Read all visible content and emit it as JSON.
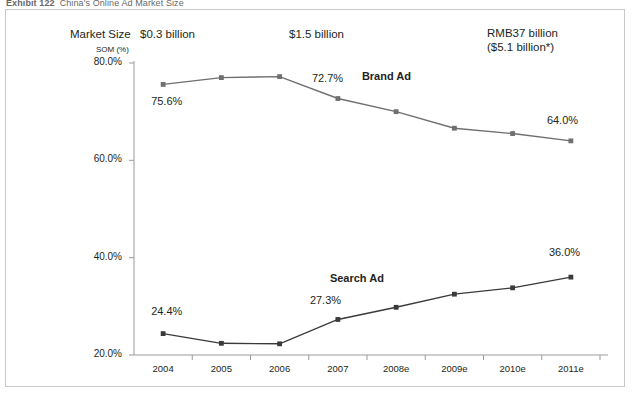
{
  "exhibit": {
    "number": "Exhibit 122",
    "title": "China's Online Ad Market Size"
  },
  "header": {
    "market_size_label": "Market Size",
    "size_2004": "$0.3 billion",
    "size_2007": "$1.5 billion",
    "size_2011_line1": "RMB37 billion",
    "size_2011_line2": "($5.1 billion*)"
  },
  "chart_data": {
    "type": "line",
    "title": "China's Online Ad Market Size",
    "xlabel": "",
    "ylabel": "SOM (%)",
    "ylim": [
      20,
      80
    ],
    "yticks": [
      20,
      40,
      60,
      80
    ],
    "ytick_labels": [
      "20.0%",
      "40.0%",
      "60.0%",
      "80.0%"
    ],
    "grid": false,
    "legend": "inline-annotations",
    "categories": [
      "2004",
      "2005",
      "2006",
      "2007",
      "2008e",
      "2009e",
      "2010e",
      "2011e"
    ],
    "series": [
      {
        "name": "Brand Ad",
        "values": [
          75.6,
          77.0,
          77.2,
          72.7,
          70.0,
          66.6,
          65.5,
          64.0
        ],
        "color": "#6f6f6f"
      },
      {
        "name": "Search Ad",
        "values": [
          24.4,
          22.4,
          22.3,
          27.3,
          29.8,
          32.5,
          33.8,
          36.0
        ],
        "color": "#3a3a3a"
      }
    ],
    "annotations": [
      {
        "text": "75.6%",
        "series": "Brand Ad",
        "category": "2004"
      },
      {
        "text": "72.7%",
        "series": "Brand Ad",
        "category": "2007"
      },
      {
        "text": "64.0%",
        "series": "Brand Ad",
        "category": "2011e"
      },
      {
        "text": "24.4%",
        "series": "Search Ad",
        "category": "2004"
      },
      {
        "text": "27.3%",
        "series": "Search Ad",
        "category": "2007"
      },
      {
        "text": "36.0%",
        "series": "Search Ad",
        "category": "2011e"
      },
      {
        "text": "Brand Ad",
        "series": "Brand Ad",
        "category": "2007"
      },
      {
        "text": "Search Ad",
        "series": "Search Ad",
        "category": "2007"
      }
    ]
  }
}
